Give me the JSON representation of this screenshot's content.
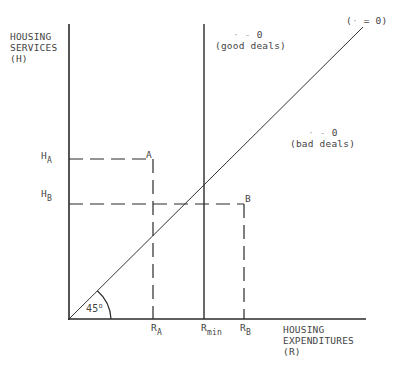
{
  "diagram": {
    "y_axis_label": [
      "HOUSING",
      "SERVICES",
      "(H)"
    ],
    "x_axis_label": [
      "HOUSING",
      "EXPENDITURES",
      "(R)"
    ],
    "diagonal_label": {
      "prefix": "(",
      "faint_symbol": "·",
      "suffix": " = 0)"
    },
    "good_deals": {
      "line1_faint": "· -",
      "line1_value": " 0",
      "line2": "(good deals)"
    },
    "bad_deals": {
      "line1_faint": "· -",
      "line1_value": " 0",
      "line2": "(bad deals)"
    },
    "y_ticks": [
      {
        "main": "H",
        "sub": "A"
      },
      {
        "main": "H",
        "sub": "B"
      }
    ],
    "x_ticks": [
      {
        "main": "R",
        "sub": "A"
      },
      {
        "main": "R",
        "sub": "min"
      },
      {
        "main": "R",
        "sub": "B"
      }
    ],
    "points": [
      {
        "label": "A"
      },
      {
        "label": "B"
      }
    ],
    "angle_label": "45",
    "angle_degree": "o",
    "colors": {
      "line": "#2a2a2a",
      "text": "#444444",
      "faint": "#aaaaaa"
    }
  }
}
